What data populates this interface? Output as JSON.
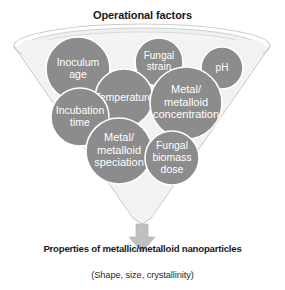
{
  "diagram": {
    "title": "Operational factors",
    "outcome_title": "Properties of metallic/metalloid nanoparticles",
    "outcome_subtitle": "(Shape, size, crystallinity)",
    "shape": "funnel",
    "arrow": "down-arrow",
    "colors": {
      "bubble_fill": "#8c8c8c",
      "bubble_text": "#ffffff",
      "funnel_outline": "#c9c9c9",
      "funnel_fill": "#f2f2f2",
      "arrow_fill": "#bfbfbf",
      "background": "#ffffff",
      "text": "#1a1a1a"
    },
    "factors": [
      {
        "id": "inoculum-age",
        "label": "Inoculum age",
        "lines": [
          "Inoculum",
          "age"
        ],
        "cx": 78,
        "cy": 69,
        "r": 32
      },
      {
        "id": "fungal-strain",
        "label": "Fungal strain",
        "lines": [
          "Fungal",
          "strain"
        ],
        "cx": 159,
        "cy": 62,
        "r": 24
      },
      {
        "id": "ph",
        "label": "pH",
        "lines": [
          "pH"
        ],
        "cx": 222,
        "cy": 68,
        "r": 21
      },
      {
        "id": "temperature",
        "label": "Temperature",
        "lines": [
          "Temperature"
        ],
        "cx": 124,
        "cy": 98,
        "r": 29
      },
      {
        "id": "metal-metalloid-concentration",
        "label": "Metal/ metalloid concentration",
        "lines": [
          "Metal/",
          "metalloid",
          "concentration"
        ],
        "cx": 186,
        "cy": 103,
        "r": 36
      },
      {
        "id": "incubation-time",
        "label": "Incubation time",
        "lines": [
          "Incubation",
          "time"
        ],
        "cx": 80,
        "cy": 117,
        "r": 29
      },
      {
        "id": "metal-metalloid-speciation",
        "label": "Metal/ metalloid speciation",
        "lines": [
          "Metal/",
          "metalloid",
          "speciation"
        ],
        "cx": 119,
        "cy": 151,
        "r": 33
      },
      {
        "id": "fungal-biomass-dose",
        "label": "Fungal biomass dose",
        "lines": [
          "Fungal",
          "biomass",
          "dose"
        ],
        "cx": 172,
        "cy": 158,
        "r": 27
      }
    ]
  }
}
